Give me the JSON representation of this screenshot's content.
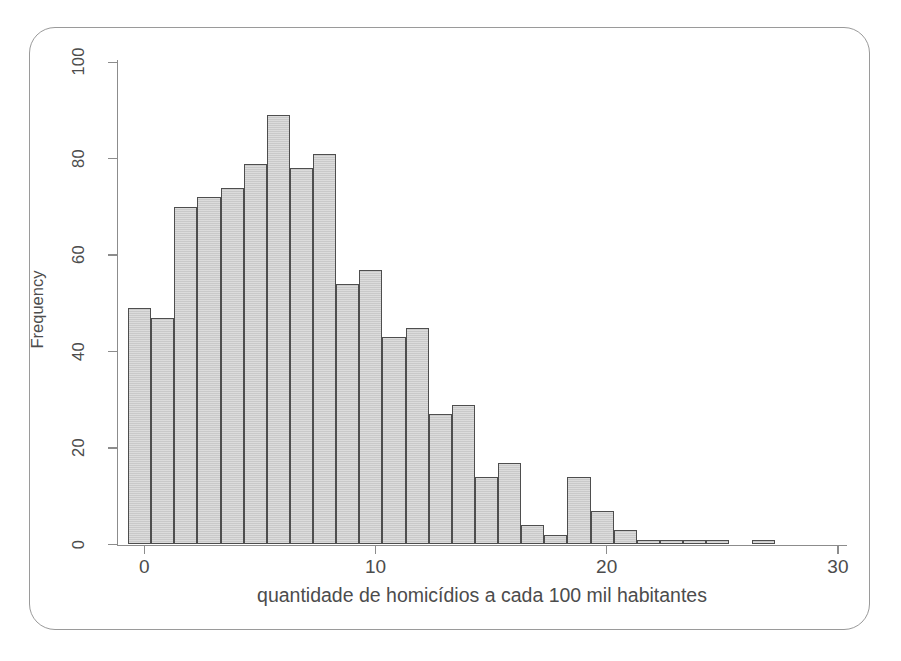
{
  "figure": {
    "border_color": "#9a9a9a",
    "background": "#ffffff"
  },
  "axes": {
    "x_title": "quantidade de homicídios a cada 100 mil habitantes",
    "y_title": "Frequency",
    "x_ticks": [
      "0",
      "10",
      "20",
      "30"
    ],
    "y_ticks": [
      "0",
      "20",
      "40",
      "60",
      "80",
      "100"
    ]
  },
  "style": {
    "bar_fill": "#c9c9c9",
    "bar_stroke": "#4e4e4e",
    "axis_color": "#8c8c8c",
    "text_color": "#4c4c4c"
  },
  "chart_data": {
    "type": "bar",
    "title": "",
    "subtitle": "",
    "xlabel": "quantidade de homicídios a cada 100 mil habitantes",
    "ylabel": "Frequency",
    "xlim": [
      -0.7,
      30.5
    ],
    "ylim": [
      0,
      105
    ],
    "xticks": [
      0,
      10,
      20,
      30
    ],
    "yticks": [
      0,
      20,
      40,
      60,
      80,
      100
    ],
    "grid": false,
    "legend": false,
    "bin_width": 1,
    "bin_left_edges": [
      -0.7,
      0.3,
      1.3,
      2.3,
      3.3,
      4.3,
      5.3,
      6.3,
      7.3,
      8.3,
      9.3,
      10.3,
      11.3,
      12.3,
      13.3,
      14.3,
      15.3,
      16.3,
      17.3,
      18.3,
      19.3,
      20.3,
      21.3,
      22.3,
      23.3,
      24.3,
      26.3
    ],
    "bin_centers": [
      -0.2,
      0.8,
      1.8,
      2.8,
      3.8,
      4.8,
      5.8,
      6.8,
      7.8,
      8.8,
      9.8,
      10.8,
      11.8,
      12.8,
      13.8,
      14.8,
      15.8,
      16.8,
      17.8,
      18.8,
      19.8,
      20.8,
      21.8,
      22.8,
      23.8,
      24.8,
      26.8
    ],
    "values": [
      49,
      47,
      70,
      72,
      74,
      79,
      89,
      78,
      81,
      54,
      57,
      43,
      45,
      27,
      29,
      14,
      17,
      4,
      2,
      14,
      7,
      3,
      1,
      1,
      1,
      1,
      1
    ],
    "categories": [
      "-0.2",
      "0.8",
      "1.8",
      "2.8",
      "3.8",
      "4.8",
      "5.8",
      "6.8",
      "7.8",
      "8.8",
      "9.8",
      "10.8",
      "11.8",
      "12.8",
      "13.8",
      "14.8",
      "15.8",
      "16.8",
      "17.8",
      "18.8",
      "19.8",
      "20.8",
      "21.8",
      "22.8",
      "23.8",
      "24.8",
      "26.8"
    ]
  }
}
